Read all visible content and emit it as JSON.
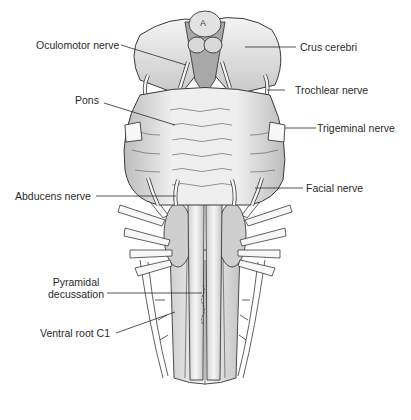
{
  "figure": {
    "marker": "A",
    "labels": {
      "oculomotor": "Oculomotor nerve",
      "crus": "Crus cerebri",
      "trochlear": "Trochlear nerve",
      "pons": "Pons",
      "trigeminal": "Trigeminal nerve",
      "abducens": "Abducens nerve",
      "facial": "Facial nerve",
      "pyramidal_line1": "Pyramidal",
      "pyramidal_line2": "decussation",
      "ventral_root": "Ventral root C1"
    },
    "colors": {
      "outline": "#3a3a3a",
      "fill_light": "#f2f2f2",
      "fill_mid": "#d6d6d6",
      "fill_dark": "#a8a8a8",
      "text": "#2a2a2a",
      "background": "#ffffff"
    }
  }
}
